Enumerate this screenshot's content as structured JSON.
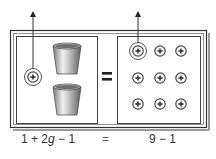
{
  "diagram": {
    "left_side": {
      "positive_unit_tiles": 1,
      "cups": 2,
      "highlighted_tile_removed": true,
      "cup_label": "g"
    },
    "right_side": {
      "positive_unit_tiles": 9,
      "grid_rows": 3,
      "grid_cols": 3,
      "highlighted_tile_removed": true
    },
    "equals_sign": "=",
    "tile_symbol": "+",
    "arrow_meaning": "remove one unit tile from each side"
  },
  "equation": {
    "left_part1": "1 + 2",
    "left_var": "g",
    "left_part2": " − 1",
    "equals": "=",
    "right": "9 − 1"
  },
  "colors": {
    "frame": "#333333",
    "frame_shadow": "#999999",
    "tile_stroke": "#333333",
    "tile_fill": "#ffffff",
    "cup_dark": "#6b6b6b",
    "cup_light": "#e6e6e6",
    "text": "#333333"
  }
}
